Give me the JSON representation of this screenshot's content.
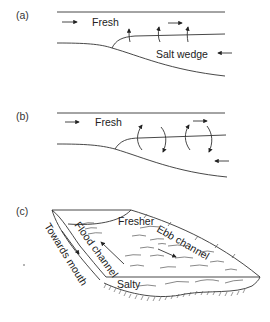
{
  "figure": {
    "panels": [
      {
        "id": "a",
        "label": "(a)",
        "labels": {
          "fresh": "Fresh",
          "salt": "Salt wedge"
        },
        "description": "Salt wedge estuary: fresh water flows seaward over a landward salt wedge; vertical entrainment arrows at interface"
      },
      {
        "id": "b",
        "label": "(b)",
        "labels": {
          "fresh": "Fresh"
        },
        "description": "Partially mixed estuary: circulating mixing arrows across interface"
      },
      {
        "id": "c",
        "label": "(c)",
        "labels": {
          "fresher": "Fresher",
          "ebb": "Ebb channel",
          "flood": "Flood channel",
          "towards": "Towards mouth",
          "salty": "Salty"
        },
        "description": "Oblique block view of estuary channel with flood and ebb channels"
      }
    ],
    "colors": {
      "line": "#333333",
      "text": "#222222",
      "background": "#ffffff"
    }
  }
}
